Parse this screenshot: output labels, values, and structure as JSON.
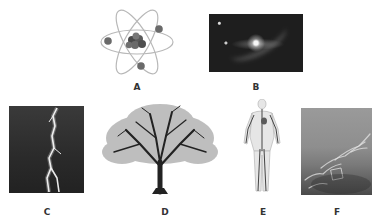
{
  "figure": {
    "panels": [
      {
        "id": "A",
        "label": "A",
        "subject": "atom-model",
        "icon": "atom-icon"
      },
      {
        "id": "B",
        "label": "B",
        "subject": "galaxy",
        "icon": "galaxy-icon"
      },
      {
        "id": "C",
        "label": "C",
        "subject": "lightning-bolt",
        "icon": "lightning-icon"
      },
      {
        "id": "D",
        "label": "D",
        "subject": "tree",
        "icon": "tree-icon"
      },
      {
        "id": "E",
        "label": "E",
        "subject": "human-circulatory-system",
        "icon": "circulatory-system-icon"
      },
      {
        "id": "F",
        "label": "F",
        "subject": "water-waves",
        "icon": "water-icon"
      }
    ]
  },
  "colors": {
    "background": "#ffffff",
    "label_text": "#333333",
    "photo_dark": "#1e1e1e",
    "atom_orbit": "#b5b5b5",
    "atom_nucleus": "#555555"
  }
}
